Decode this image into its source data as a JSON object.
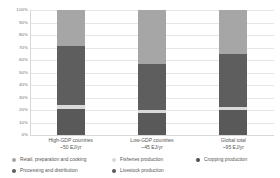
{
  "chart_data": {
    "type": "bar",
    "title": "",
    "subtitle": "",
    "xlabel": "",
    "ylabel": "",
    "ylim": [
      0,
      100
    ],
    "stacked": true,
    "stack_mode": "percent",
    "grid": true,
    "grid_axis": "y",
    "legend_position": "bottom",
    "legend_columns": 3,
    "y_ticks": [
      "0%",
      "10%",
      "20%",
      "30%",
      "40%",
      "50%",
      "60%",
      "70%",
      "80%",
      "90%",
      "100%"
    ],
    "y_tick_values": [
      0,
      10,
      20,
      30,
      40,
      50,
      60,
      70,
      80,
      90,
      100
    ],
    "categories": [
      "High-GDP countries",
      "Low-GDP countries",
      "Global total"
    ],
    "category_sublabels": [
      "~50 EJ/yr",
      "~45 EJ/yr",
      "~95 EJ/yr"
    ],
    "series": [
      {
        "name": "Retail, preparation and cooking",
        "color": "#a6a6a6",
        "values": [
          29,
          43,
          35
        ]
      },
      {
        "name": "Processing and distribution",
        "color": "#5e5e5e",
        "values": [
          47,
          37,
          42.5
        ]
      },
      {
        "name": "Fisheries production",
        "color": "#d9d9d9",
        "values": [
          3,
          2.5,
          2.5
        ]
      },
      {
        "name": "Livestock production",
        "color": "#595959",
        "values": [
          21,
          17.5,
          20
        ]
      },
      {
        "name": "Cropping production",
        "color": "#4f4f4f",
        "values": [
          0,
          0,
          0
        ]
      }
    ]
  },
  "legend": {
    "columns": [
      {
        "items": [
          {
            "label": "Retail, preparation and cooking",
            "color": "#a6a6a6"
          },
          {
            "label": "Processing and distribution",
            "color": "#5e5e5e"
          }
        ]
      },
      {
        "items": [
          {
            "label": "Fisheries production",
            "color": "#d9d9d9"
          },
          {
            "label": "Livestock production",
            "color": "#595959"
          }
        ]
      },
      {
        "items": [
          {
            "label": "Cropping production",
            "color": "#4f4f4f"
          }
        ]
      }
    ]
  },
  "colors": {
    "retail_preparation_cooking": "#a6a6a6",
    "processing_distribution": "#5e5e5e",
    "fisheries_production": "#d9d9d9",
    "livestock_production": "#595959",
    "cropping_production": "#4f4f4f",
    "gridline": "#e6e6e6",
    "text": "#555555",
    "background": "#ffffff"
  }
}
